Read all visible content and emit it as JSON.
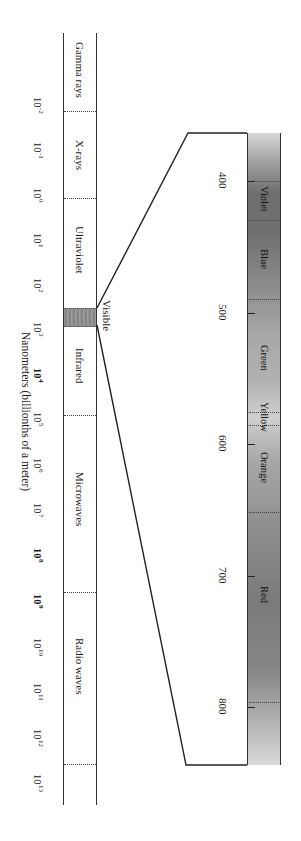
{
  "diagram": {
    "orientation": "rotated-90-clockwise",
    "axis_label": "Nanometers (billionths of a meter)",
    "spectrum_bands": [
      {
        "label": "Gamma rays"
      },
      {
        "label": "X-rays"
      },
      {
        "label": "Ultraviolet"
      },
      {
        "label": "Visible"
      },
      {
        "label": "Infrared"
      },
      {
        "label": "Microwaves"
      },
      {
        "label": "Radio waves"
      }
    ],
    "wavelength_ticks": [
      {
        "base": "10",
        "exp": "-2",
        "bold": false
      },
      {
        "base": "10",
        "exp": "-1",
        "bold": false
      },
      {
        "base": "10",
        "exp": "0",
        "bold": false
      },
      {
        "base": "10",
        "exp": "1",
        "bold": false
      },
      {
        "base": "10",
        "exp": "2",
        "bold": false
      },
      {
        "base": "10",
        "exp": "3",
        "bold": false
      },
      {
        "base": "10",
        "exp": "4",
        "bold": true
      },
      {
        "base": "10",
        "exp": "5",
        "bold": false
      },
      {
        "base": "10",
        "exp": "6",
        "bold": false
      },
      {
        "base": "10",
        "exp": "7",
        "bold": false
      },
      {
        "base": "10",
        "exp": "8",
        "bold": true
      },
      {
        "base": "10",
        "exp": "9",
        "bold": true
      },
      {
        "base": "10",
        "exp": "10",
        "bold": false
      },
      {
        "base": "10",
        "exp": "11",
        "bold": false
      },
      {
        "base": "10",
        "exp": "12",
        "bold": false
      },
      {
        "base": "10",
        "exp": "13",
        "bold": false
      }
    ],
    "visible_spectrum": {
      "nm_ticks": [
        "400",
        "500",
        "600",
        "700",
        "800"
      ],
      "colors": [
        {
          "label": "Violet",
          "shade": "#6e6e6e"
        },
        {
          "label": "Blue",
          "shade": "#7a7a7a"
        },
        {
          "label": "Green",
          "shade": "#9a9a9a"
        },
        {
          "label": "Yellow",
          "shade": "#c4c4c4"
        },
        {
          "label": "Orange",
          "shade": "#a8a8a8"
        },
        {
          "label": "Red",
          "shade": "#808080"
        }
      ]
    },
    "colors": {
      "line": "#333333",
      "visible_band": "#8c8c8c",
      "background": "#ffffff"
    }
  }
}
